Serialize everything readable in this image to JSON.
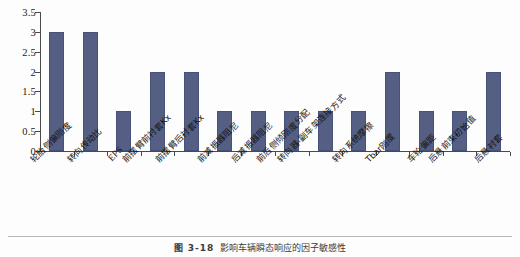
{
  "chart_data": {
    "type": "bar",
    "title": "",
    "xlabel": "",
    "ylabel": "",
    "ylim": [
      0,
      3.5
    ],
    "yticks": [
      "0",
      "0.5",
      "1",
      "1.5",
      "2",
      "2.5",
      "3",
      "3.5"
    ],
    "grid": false,
    "legend": null,
    "bar_color": "#545f83",
    "categories": [
      "轮胎侧偏刚度",
      "转向传动比",
      "EPS",
      "前摆臂前衬套Kx",
      "前摆臂后衬套Kx",
      "前减振器阻尼",
      "后减振器阻尼",
      "前后侧倾刚度分配",
      "转向器-副车架连接方式",
      "转向系统摩擦",
      "Tbar刚度",
      "车轮偏距",
      "后悬前束初始值",
      "后悬衬套"
    ],
    "values": [
      3,
      3,
      1,
      2,
      2,
      1,
      1,
      1,
      1,
      1,
      2,
      1,
      1,
      2
    ]
  },
  "caption": {
    "number": "图 3-18",
    "text": "影响车辆瞬态响应的因子敏感性"
  }
}
